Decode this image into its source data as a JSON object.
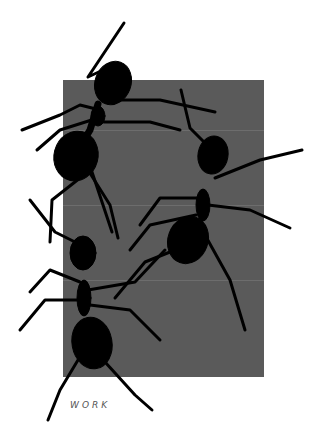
{
  "artwork": {
    "caption": "WORK",
    "panel_color": "#5a5a5a",
    "ant_color": "#000000",
    "background_color": "#ffffff",
    "ant_count": 3
  }
}
